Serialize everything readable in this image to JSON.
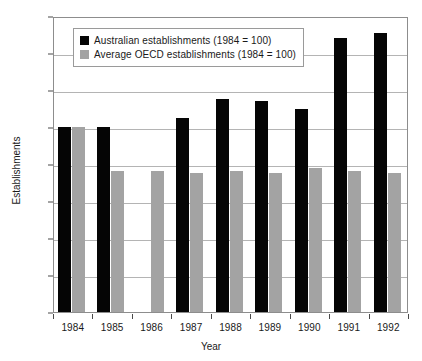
{
  "chart_data": {
    "type": "bar",
    "title": "",
    "subtitle": "",
    "xlabel": "Year",
    "ylabel": "Establishments",
    "categories": [
      "1984",
      "1985",
      "1986",
      "1987",
      "1988",
      "1989",
      "1990",
      "1991",
      "1992"
    ],
    "series": [
      {
        "name": "Australian establishments (1984 = 100)",
        "color": "#050505",
        "values": [
          100,
          100,
          null,
          105,
          115,
          114,
          110,
          148,
          151
        ]
      },
      {
        "name": "Average OECD establishments (1984 = 100)",
        "color": "#a3a3a3",
        "values": [
          100,
          76,
          76,
          75,
          76,
          75,
          78,
          76,
          75
        ]
      }
    ],
    "ylim": [
      0,
      160
    ],
    "ytick_values": [
      0,
      20,
      40,
      60,
      80,
      100,
      120,
      140,
      160
    ],
    "ytick_labels": [
      "0",
      "20",
      "40",
      "60",
      "80",
      "100",
      "120",
      "140",
      "160"
    ],
    "grid": true,
    "grid_axis": "y",
    "legend_position": "upper-left-inside"
  },
  "legend": {
    "entries": [
      {
        "label": "Australian establishments (1984 = 100)",
        "swatch": "black"
      },
      {
        "label": "Average OECD establishments (1984 = 100)",
        "swatch": "grey"
      }
    ]
  },
  "axes": {
    "y_title": "Establishments",
    "x_title": "Year"
  },
  "colors": {
    "series_black": "#050505",
    "series_grey": "#a3a3a3",
    "gridline": "#b4b4b4",
    "frame": "#8d8d8d",
    "background": "#ffffff",
    "text": "#1a1a1a"
  }
}
